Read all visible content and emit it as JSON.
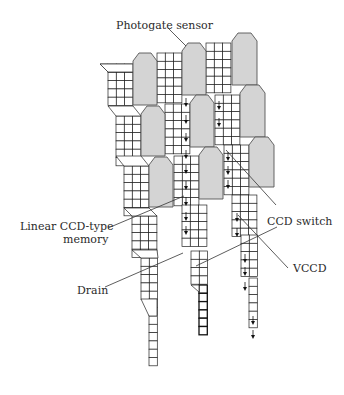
{
  "figure": {
    "type": "diagram",
    "labels": {
      "photogate": "Photogate sensor",
      "memory_line1": "Linear CCD-type",
      "memory_line2": "memory",
      "ccd_switch": "CCD switch",
      "vccd": "VCCD",
      "drain": "Drain"
    },
    "colors": {
      "sensor_fill": "#d4d4d4",
      "grid_stroke": "#222222",
      "background": "#ffffff"
    }
  }
}
